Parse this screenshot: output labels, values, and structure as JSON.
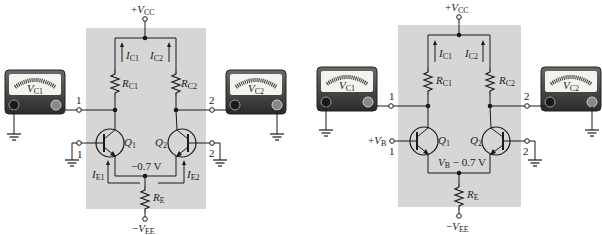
{
  "figure": {
    "colors": {
      "shade": "#d6d6d6",
      "wire": "#1a1a1a",
      "meter_body": "#3a3a3a",
      "meter_face": "#f4f4ee"
    }
  },
  "left_circuit": {
    "supply_top": {
      "sign": "+",
      "v": "V",
      "sub": "CC"
    },
    "supply_bottom": {
      "sign": "−",
      "v": "V",
      "sub": "EE"
    },
    "ic1": {
      "i": "I",
      "sub": "C1"
    },
    "ic2": {
      "i": "I",
      "sub": "C2"
    },
    "rc1": {
      "r": "R",
      "sub": "C1"
    },
    "rc2": {
      "r": "R",
      "sub": "C2"
    },
    "re": {
      "r": "R",
      "sub": "E"
    },
    "q1": {
      "q": "Q",
      "sub": "1"
    },
    "q2": {
      "q": "Q",
      "sub": "2"
    },
    "ie1": {
      "i": "I",
      "sub": "E1"
    },
    "ie2": {
      "i": "I",
      "sub": "E2"
    },
    "emitter_voltage": "−0.7 V",
    "node_out1": "1",
    "node_out2": "2",
    "node_in1": "1",
    "node_in2": "2",
    "meter1": {
      "v": "V",
      "sub": "C1",
      "neg": "−",
      "pos": "+"
    },
    "meter2": {
      "v": "V",
      "sub": "C2",
      "neg": "−",
      "pos": "+"
    }
  },
  "right_circuit": {
    "supply_top": {
      "sign": "+",
      "v": "V",
      "sub": "CC"
    },
    "supply_bottom": {
      "sign": "−",
      "v": "V",
      "sub": "EE"
    },
    "ic1": {
      "i": "I",
      "sub": "C1"
    },
    "ic2": {
      "i": "I",
      "sub": "C2"
    },
    "rc1": {
      "r": "R",
      "sub": "C1"
    },
    "rc2": {
      "r": "R",
      "sub": "C2"
    },
    "re": {
      "r": "R",
      "sub": "E"
    },
    "q1": {
      "q": "Q",
      "sub": "1"
    },
    "q2": {
      "q": "Q",
      "sub": "2"
    },
    "input_voltage": {
      "sign": "+",
      "v": "V",
      "sub": "B"
    },
    "emitter_voltage": {
      "v": "V",
      "sub": "B",
      "rest": " − 0.7 V"
    },
    "node_out1": "1",
    "node_out2": "2",
    "node_in1": "1",
    "node_in2": "2",
    "meter1": {
      "v": "V",
      "sub": "C1",
      "neg": "−",
      "pos": "+"
    },
    "meter2": {
      "v": "V",
      "sub": "C2",
      "neg": "−",
      "pos": "+"
    }
  }
}
